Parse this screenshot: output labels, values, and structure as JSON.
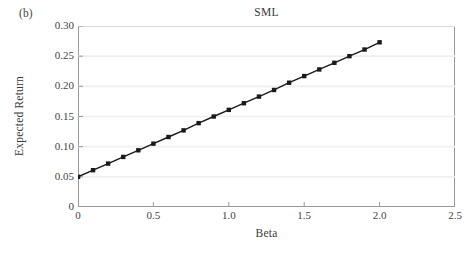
{
  "figure": {
    "panel_label": "(b)",
    "background_color": "#ffffff",
    "frame_color": "#9a9a9a",
    "gridline_color": "#efefef",
    "series_color": "#1a1a1a"
  },
  "chart_data": {
    "type": "line",
    "title": "SML",
    "xlabel": "Beta",
    "ylabel": "Expected Return",
    "xlim": [
      0,
      2.5
    ],
    "ylim": [
      0,
      0.3
    ],
    "grid": true,
    "legend": null,
    "marker": "square",
    "xticks": [
      0,
      0.5,
      1.0,
      1.5,
      2.0,
      2.5
    ],
    "xticklabels": [
      "0",
      "0.5",
      "1.0",
      "1.5",
      "2.0",
      "2.5"
    ],
    "yticks": [
      0,
      0.05,
      0.1,
      0.15,
      0.2,
      0.25,
      0.3
    ],
    "yticklabels": [
      "0",
      "0.05",
      "0.10",
      "0.15",
      "0.20",
      "0.25",
      "0.30"
    ],
    "series": [
      {
        "name": "SML",
        "x": [
          0,
          0.1,
          0.2,
          0.3,
          0.4,
          0.5,
          0.6,
          0.7,
          0.8,
          0.9,
          1.0,
          1.1,
          1.2,
          1.3,
          1.4,
          1.5,
          1.6,
          1.7,
          1.8,
          1.9,
          2.0
        ],
        "y": [
          0.05,
          0.061,
          0.072,
          0.083,
          0.094,
          0.105,
          0.116,
          0.127,
          0.139,
          0.15,
          0.161,
          0.172,
          0.183,
          0.194,
          0.206,
          0.217,
          0.228,
          0.239,
          0.25,
          0.261,
          0.273
        ]
      }
    ],
    "annotations": [
      "(b)"
    ]
  }
}
